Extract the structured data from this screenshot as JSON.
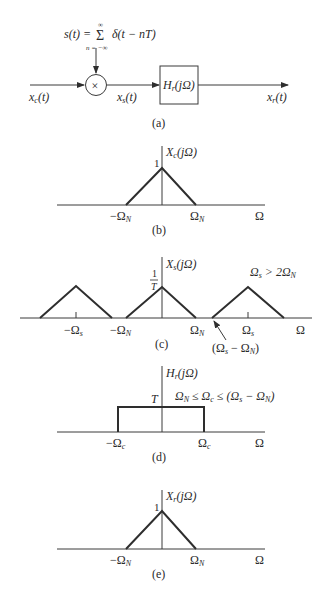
{
  "figure": {
    "panels": {
      "a": {
        "caption": "(a)",
        "sampling_signal": "s(t) = Σ δ(t − nT)",
        "sampling_lhs": "s(t) =",
        "sum_symbol": "Σ",
        "sum_upper": "∞",
        "sum_lower": "n = −∞",
        "sum_term": "δ(t − nT)",
        "multiplier_symbol": "×",
        "input_label": "x",
        "input_sub": "c",
        "input_arg": "(t)",
        "sampled_label": "x",
        "sampled_sub": "s",
        "sampled_arg": "(t)",
        "filter_label": "H",
        "filter_sub": "r",
        "filter_arg": "(jΩ)",
        "output_label": "x",
        "output_sub": "r",
        "output_arg": "(t)"
      },
      "b": {
        "caption": "(b)",
        "ylabel": "X",
        "ylabel_sub": "c",
        "ylabel_arg": "(jΩ)",
        "peak_label": "1",
        "neg_tick": "−Ω",
        "neg_tick_sub": "N",
        "pos_tick": "Ω",
        "pos_tick_sub": "N",
        "xlabel": "Ω"
      },
      "c": {
        "caption": "(c)",
        "ylabel": "X",
        "ylabel_sub": "s",
        "ylabel_arg": "(jΩ)",
        "peak_num": "1",
        "peak_den": "T",
        "condition": "Ω",
        "condition_sub": "s",
        "condition_rest": " > 2Ω",
        "condition_sub2": "N",
        "ticks": [
          {
            "label": "−Ω",
            "sub": "s"
          },
          {
            "label": "−Ω",
            "sub": "N"
          },
          {
            "label": "Ω",
            "sub": "N"
          },
          {
            "label": "Ω",
            "sub": "s"
          }
        ],
        "annotation": "(Ω",
        "annotation_sub": "s",
        "annotation_mid": " − Ω",
        "annotation_sub2": "N",
        "annotation_end": ")",
        "xlabel": "Ω"
      },
      "d": {
        "caption": "(d)",
        "ylabel": "H",
        "ylabel_sub": "r",
        "ylabel_arg": "(jΩ)",
        "gain_label": "T",
        "condition": "Ω",
        "condition_sub1": "N",
        "condition_mid1": " ≤ Ω",
        "condition_sub2": "c",
        "condition_mid2": " ≤ (Ω",
        "condition_sub3": "s",
        "condition_mid3": " − Ω",
        "condition_sub4": "N",
        "condition_end": ")",
        "neg_tick": "−Ω",
        "neg_tick_sub": "c",
        "pos_tick": "Ω",
        "pos_tick_sub": "c",
        "xlabel": "Ω"
      },
      "e": {
        "caption": "(e)",
        "ylabel": "X",
        "ylabel_sub": "r",
        "ylabel_arg": "(jΩ)",
        "peak_label": "1",
        "neg_tick": "−Ω",
        "neg_tick_sub": "N",
        "pos_tick": "Ω",
        "pos_tick_sub": "N",
        "xlabel": "Ω"
      }
    }
  }
}
